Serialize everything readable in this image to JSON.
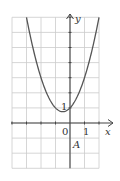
{
  "chart_data": {
    "type": "line",
    "title": "",
    "function": "y = x^2 + x + 1",
    "xlabel": "x",
    "ylabel": "y",
    "xlim": [
      -4,
      2
    ],
    "ylim": [
      -3,
      7
    ],
    "grid": true,
    "tick_labels": {
      "origin": "0",
      "x_one": "1",
      "y_one": "1"
    },
    "annotation": "A",
    "x": [
      -3,
      -2.5,
      -2,
      -1.5,
      -1,
      -0.5,
      0,
      0.5,
      1,
      1.5,
      2
    ],
    "values": [
      7,
      4.75,
      3,
      1.75,
      1,
      0.75,
      1,
      1.75,
      3,
      4.75,
      7
    ],
    "colors": {
      "curve": "#555555",
      "axis": "#444444",
      "grid": "#cccccc"
    }
  },
  "labels": {
    "x_axis": "x",
    "y_axis": "y",
    "origin": "0",
    "x_tick_1": "1",
    "y_tick_1": "1",
    "point": "A"
  }
}
